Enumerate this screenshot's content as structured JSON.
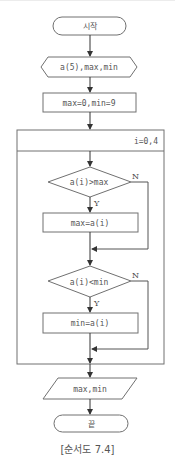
{
  "diagram": {
    "type": "flowchart",
    "start": {
      "label": "시작"
    },
    "input": {
      "label": "a(5),max,min"
    },
    "init": {
      "label": "max=0,min=9"
    },
    "loop": {
      "label": "i=0,4"
    },
    "cond1": {
      "label": "a(i)>max",
      "yes": "Y",
      "no": "N"
    },
    "assign1": {
      "label": "max=a(i)"
    },
    "cond2": {
      "label": "a(i)<min",
      "yes": "Y",
      "no": "N"
    },
    "assign2": {
      "label": "min=a(i)"
    },
    "output": {
      "label": "max,min"
    },
    "end": {
      "label": "끝"
    },
    "caption": "[순서도 7.4]",
    "colors": {
      "stroke": "#707070",
      "text": "#555555",
      "background": "#ffffff"
    }
  }
}
